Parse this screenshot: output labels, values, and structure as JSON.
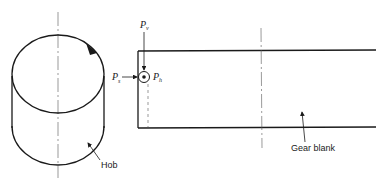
{
  "diagram": {
    "labels": {
      "hob": "Hob",
      "gear_blank": "Gear blank",
      "pv_main": "P",
      "pv_sub": "v",
      "ps_main": "P",
      "ps_sub": "s",
      "ph_main": "P",
      "ph_sub": "h"
    },
    "colors": {
      "stroke": "#1a1a1a",
      "background": "#ffffff"
    }
  }
}
